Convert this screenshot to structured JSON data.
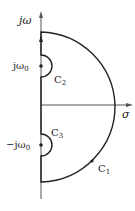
{
  "diagram": {
    "type": "nyquist-contour",
    "axes": {
      "vertical_label": "jω",
      "horizontal_label": "σ"
    },
    "points": {
      "upper_pole": {
        "label": "jω",
        "subscript": "0"
      },
      "lower_pole": {
        "label": "−jω",
        "subscript": "0"
      }
    },
    "contours": {
      "c1": {
        "label": "C",
        "subscript": "1"
      },
      "c2": {
        "label": "C",
        "subscript": "2"
      },
      "c3": {
        "label": "C",
        "subscript": "3"
      }
    },
    "colors": {
      "stroke": "#222222",
      "axis": "#555555",
      "background": "#ffffff"
    }
  }
}
